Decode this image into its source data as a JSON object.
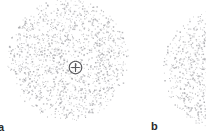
{
  "figure": {
    "background_color": "#ffffff",
    "stipple_color": "#a9a9ad",
    "marker_color": "#58585c",
    "label_color": "#2b2b2b",
    "panels": [
      {
        "id": "a",
        "label": "a",
        "label_x": -2,
        "label_y": 122,
        "shape": "circle",
        "center_x": 68,
        "center_y": 60,
        "radius": 61,
        "dot_count": 1750,
        "density_profile": "uniform-with-soft-edge",
        "marker": {
          "name": "positive-charge",
          "symbol": "+",
          "center_x": 75,
          "center_y": 67,
          "diameter": 15
        }
      },
      {
        "id": "b",
        "label": "b",
        "label_x": 151,
        "label_y": 121,
        "shape": "circle",
        "center_x": 225,
        "center_y": 70,
        "radius": 62,
        "dot_count": 1750,
        "density_profile": "uniform-with-soft-edge",
        "marker": null,
        "clipped_right_edge": true
      }
    ]
  }
}
